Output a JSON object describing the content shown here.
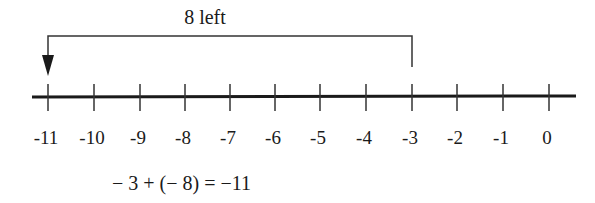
{
  "diagram": {
    "type": "number-line",
    "jump_label": "8 left",
    "start_value": -3,
    "end_value": -11,
    "direction": "left",
    "ticks": [
      {
        "value": -11,
        "label": "-11",
        "x": 48
      },
      {
        "value": -10,
        "label": "-10",
        "x": 94
      },
      {
        "value": -9,
        "label": "-9",
        "x": 140
      },
      {
        "value": -8,
        "label": "-8",
        "x": 185
      },
      {
        "value": -7,
        "label": "-7",
        "x": 230
      },
      {
        "value": -6,
        "label": "-6",
        "x": 275
      },
      {
        "value": -5,
        "label": "-5",
        "x": 320
      },
      {
        "value": -4,
        "label": "-4",
        "x": 366
      },
      {
        "value": -3,
        "label": "-3",
        "x": 412
      },
      {
        "value": -2,
        "label": "-2",
        "x": 457
      },
      {
        "value": -1,
        "label": "-1",
        "x": 503
      },
      {
        "value": 0,
        "label": "0",
        "x": 549
      }
    ],
    "equation": "− 3 + (− 8) = −11",
    "colors": {
      "ink": "#1a1a1a",
      "background": "#ffffff"
    }
  }
}
